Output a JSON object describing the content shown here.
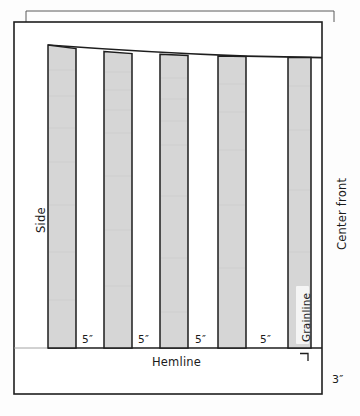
{
  "figure": {
    "kind": "sewing-pattern-diagram",
    "title_text": "",
    "labels": {
      "side": "Side",
      "center_front": "Center front",
      "grainline": "Grainline",
      "hemline": "Hemline",
      "hem_depth": "3″"
    },
    "segment_labels": [
      "5″",
      "5″",
      "5″",
      "5″"
    ],
    "colors": {
      "panel_fill": "#d6d6d6",
      "outline": "#1e1e1e",
      "page_edge": "#4a4a4a",
      "background": "#fefefe",
      "text": "#1b1b1b"
    },
    "geometry": {
      "frame": {
        "x": 14,
        "y": 22,
        "width": 308,
        "height": 372
      },
      "page_edge_offset": {
        "dx": 12,
        "dy": -11
      },
      "hemline_y": 348,
      "panel_top_left_y": 45,
      "panel_top_right_y": 57,
      "panels": [
        {
          "left": 48,
          "right": 76,
          "top_left": 45,
          "top_right": 48.5
        },
        {
          "left": 104,
          "right": 132,
          "top_left": 52,
          "top_right": 53.5
        },
        {
          "left": 160,
          "right": 188,
          "top_left": 54.5,
          "top_right": 55.5
        },
        {
          "left": 218,
          "right": 246,
          "top_left": 56,
          "top_right": 56.5
        },
        {
          "left": 288,
          "right": 311,
          "top_left": 57,
          "top_right": 57
        }
      ],
      "segment_label_x": [
        86,
        142,
        199,
        264
      ],
      "right_angle_mark": {
        "x": 306,
        "y": 352,
        "size": 6
      }
    }
  }
}
